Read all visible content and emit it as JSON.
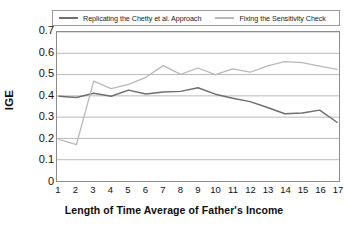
{
  "chart_data": {
    "type": "line",
    "title": "",
    "xlabel": "Length of Time Average of Father's Income",
    "ylabel": "IGE",
    "x": [
      1,
      2,
      3,
      4,
      5,
      6,
      7,
      8,
      9,
      10,
      11,
      12,
      13,
      14,
      15,
      16,
      17
    ],
    "xlim": [
      1,
      17
    ],
    "ylim": [
      0,
      0.7
    ],
    "ytick_labels": [
      "0",
      "0.1",
      "0.2",
      "0.3",
      "0.4",
      "0.5",
      "0.6",
      "0.7"
    ],
    "ytick_values": [
      0,
      0.1,
      0.2,
      0.3,
      0.4,
      0.5,
      0.6,
      0.7
    ],
    "xtick_labels": [
      "1",
      "2",
      "3",
      "4",
      "5",
      "6",
      "7",
      "8",
      "9",
      "10",
      "11",
      "12",
      "13",
      "14",
      "15",
      "16",
      "17"
    ],
    "grid": true,
    "grid_axis": "y",
    "legend_position": "top",
    "series": [
      {
        "name": "Replicating the Chetty et al. Approach",
        "color": "#6e6e6e",
        "values": [
          0.398,
          0.392,
          0.412,
          0.398,
          0.427,
          0.409,
          0.418,
          0.421,
          0.438,
          0.408,
          0.389,
          0.373,
          0.345,
          0.316,
          0.319,
          0.333,
          0.276
        ]
      },
      {
        "name": "Fixing the Sensitivity Check",
        "color": "#b8b8b8",
        "values": [
          0.195,
          0.171,
          0.469,
          0.434,
          0.454,
          0.487,
          0.542,
          0.501,
          0.531,
          0.5,
          0.527,
          0.511,
          0.541,
          0.561,
          0.556,
          0.54,
          0.524
        ]
      }
    ]
  },
  "legend": {
    "entries": [
      {
        "label": "Replicating the Chetty et al. Approach"
      },
      {
        "label": "Fixing the Sensitivity Check"
      }
    ]
  },
  "axes": {
    "y_title": "IGE",
    "x_title": "Length of Time Average of Father's Income"
  }
}
